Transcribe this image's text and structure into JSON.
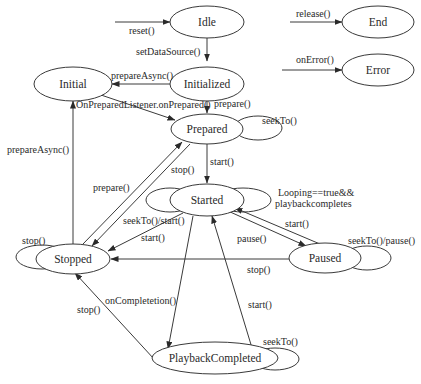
{
  "diagram": {
    "states": {
      "idle": "Idle",
      "initialized": "Initialized",
      "initial": "Initial",
      "prepared": "Prepared",
      "started": "Started",
      "stopped": "Stopped",
      "paused": "Paused",
      "playback_completed": "PlaybackCompleted",
      "end": "End",
      "error": "Error"
    },
    "transitions": {
      "reset": "reset()",
      "set_data_source": "setDataSource()",
      "prepare_async_init": "prepareAsync()",
      "on_prepared": "OnPreparedListener.onPrepared()",
      "prepare_init": "prepare()",
      "seek_to_prepared": "seekTo()",
      "prepare_async_stopped": "prepareAsync()",
      "stop_prepared": "stop()",
      "prepare_stopped": "prepare()",
      "start_prepared": "start()",
      "looping_line1": "Looping==true&&",
      "looping_line2": "playbackcompletes",
      "seek_start": "seekTo()/start()",
      "start_started": "start()",
      "stop_self": "stop()",
      "start_paused": "start()",
      "pause": "pause()",
      "seek_pause": "seekTo()/pause()",
      "stop_paused": "stop()",
      "on_completion": "onCompletetion()",
      "stop_completed": "stop()",
      "start_completed": "start()",
      "seek_completed": "seekTo()",
      "release": "release()",
      "on_error": "onError()"
    }
  }
}
